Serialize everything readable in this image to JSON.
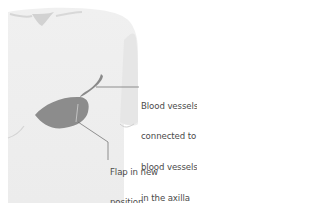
{
  "figure": {
    "labels": {
      "vessels": [
        "Blood vessels",
        "connected to",
        "blood vessels",
        "in the axilla"
      ],
      "flap": [
        "Flap in new",
        "position"
      ]
    },
    "colors": {
      "background": "#ffffff",
      "skin": "#ebebeb",
      "skin_shadow": "#d6d6d6",
      "flap": "#8c8c8c",
      "vessel": "#8a8a8a",
      "leader_line": "#666666",
      "text": "#4a4a4a"
    }
  }
}
